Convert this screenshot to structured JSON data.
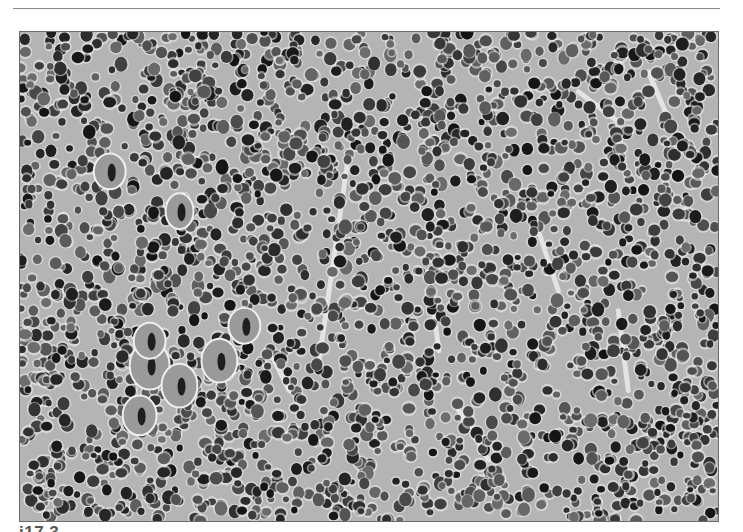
{
  "page": {
    "figure": {
      "alt": "Grayscale photomicrograph of densely packed hematopoietic cells with scattered large multinucleated cells",
      "palette": {
        "background": "#b4b4b4",
        "cytoplasm": "#9a9a9a",
        "nucleus": "#1e1e1e",
        "stroma": "#efefef",
        "frame": "#6a6a6a"
      }
    },
    "caption": {
      "label": "i17.3"
    }
  }
}
